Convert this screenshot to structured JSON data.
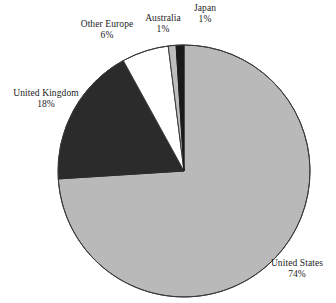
{
  "chart_data": {
    "type": "pie",
    "title": "",
    "subtitle": "",
    "xlabel": "",
    "ylabel": "",
    "legend_position": "none",
    "grid": false,
    "labels_show_percent": true,
    "start_angle_deg": 0,
    "direction": "clockwise",
    "categories": [
      "United States",
      "Japan",
      "Australia",
      "Other Europe",
      "United Kingdom"
    ],
    "values": [
      74,
      1,
      1,
      6,
      18
    ],
    "unit": "%",
    "slices": [
      {
        "name": "United States",
        "value": 74,
        "value_label": "74%",
        "color": "#b9b9b9",
        "stroke": "#3a3a3a",
        "start_deg": 0,
        "end_deg": 266.4
      },
      {
        "name": "United Kingdom",
        "value": 18,
        "value_label": "18%",
        "color": "#2b2b2b",
        "stroke": "#2b2b2b",
        "start_deg": 266.4,
        "end_deg": 331.2
      },
      {
        "name": "Other Europe",
        "value": 6,
        "value_label": "6%",
        "color": "#ffffff",
        "stroke": "#3a3a3a",
        "start_deg": 331.2,
        "end_deg": 352.8
      },
      {
        "name": "Australia",
        "value": 1,
        "value_label": "1%",
        "color": "#bdbdbd",
        "stroke": "#3a3a3a",
        "start_deg": 352.8,
        "end_deg": 356.4
      },
      {
        "name": "Japan",
        "value": 1,
        "value_label": "1%",
        "color": "#1a1a1a",
        "stroke": "#1a1a1a",
        "start_deg": 356.4,
        "end_deg": 360
      }
    ]
  },
  "labels": {
    "japan": {
      "name": "Japan",
      "value": "1%"
    },
    "australia": {
      "name": "Australia",
      "value": "1%"
    },
    "other_europe": {
      "name": "Other Europe",
      "value": "6%"
    },
    "united_kingdom": {
      "name": "United Kingdom",
      "value": "18%"
    },
    "united_states": {
      "name": "United States",
      "value": "74%"
    }
  },
  "colors": {
    "background": "#ffffff",
    "text": "#1c1c1c",
    "outline": "#3a3a3a",
    "united_states": "#b9b9b9",
    "united_kingdom": "#2b2b2b",
    "other_europe": "#ffffff",
    "australia": "#bdbdbd",
    "japan": "#1a1a1a"
  }
}
